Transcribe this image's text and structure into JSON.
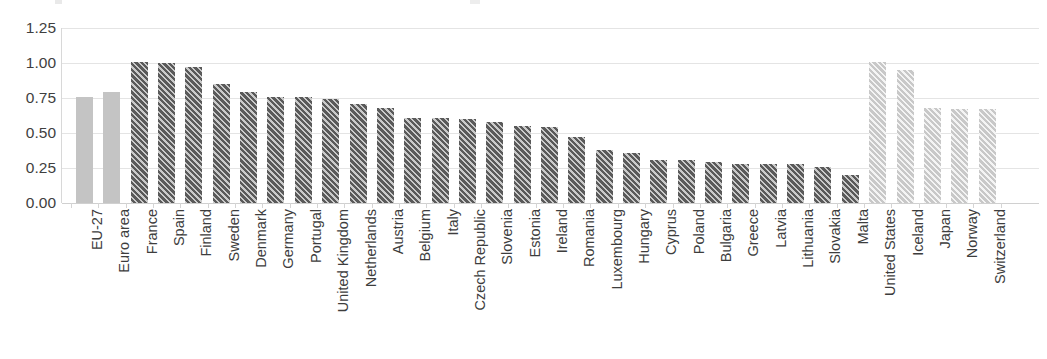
{
  "chart_data": {
    "type": "bar",
    "title": "",
    "subtitle": "",
    "xlabel": "",
    "ylabel": "",
    "ylim": [
      0,
      1.25
    ],
    "grid": true,
    "legend": "none",
    "y_ticks": [
      "0.00",
      "0.25",
      "0.50",
      "0.75",
      "1.00",
      "1.25"
    ],
    "y_tick_values": [
      0,
      0.25,
      0.5,
      0.75,
      1.0,
      1.25
    ],
    "categories": [
      "EU-27",
      "Euro area",
      "France",
      "Spain",
      "Finland",
      "Sweden",
      "Denmark",
      "Germany",
      "Portugal",
      "United Kingdom",
      "Netherlands",
      "Austria",
      "Belgium",
      "Italy",
      "Czech Republic",
      "Slovenia",
      "Estonia",
      "Ireland",
      "Romania",
      "Luxembourg",
      "Hungary",
      "Cyprus",
      "Poland",
      "Bulgaria",
      "Greece",
      "Latvia",
      "Lithuania",
      "Slovakia",
      "Malta",
      "United States",
      "Iceland",
      "Japan",
      "Norway",
      "Switzerland"
    ],
    "values": [
      0.76,
      0.79,
      1.01,
      1.0,
      0.97,
      0.85,
      0.79,
      0.76,
      0.76,
      0.74,
      0.71,
      0.68,
      0.61,
      0.61,
      0.6,
      0.58,
      0.55,
      0.54,
      0.47,
      0.38,
      0.36,
      0.31,
      0.31,
      0.29,
      0.28,
      0.28,
      0.28,
      0.26,
      0.2,
      1.01,
      0.95,
      0.68,
      0.67,
      0.67
    ],
    "styles": [
      "solid-gray",
      "solid-gray",
      "dark-hatch",
      "dark-hatch",
      "dark-hatch",
      "dark-hatch",
      "dark-hatch",
      "dark-hatch",
      "dark-hatch",
      "dark-hatch",
      "dark-hatch",
      "dark-hatch",
      "dark-hatch",
      "dark-hatch",
      "dark-hatch",
      "dark-hatch",
      "dark-hatch",
      "dark-hatch",
      "dark-hatch",
      "dark-hatch",
      "dark-hatch",
      "dark-hatch",
      "dark-hatch",
      "dark-hatch",
      "dark-hatch",
      "dark-hatch",
      "dark-hatch",
      "dark-hatch",
      "dark-hatch",
      "light-hatch",
      "light-hatch",
      "light-hatch",
      "light-hatch",
      "light-hatch"
    ],
    "colors": {
      "solid_gray": "#c4c4c4",
      "dark_hatch": "#5a5a5a",
      "light_hatch": "#c8c8c8",
      "gridline": "#e4e4e4",
      "text": "#3d3d3d"
    }
  }
}
